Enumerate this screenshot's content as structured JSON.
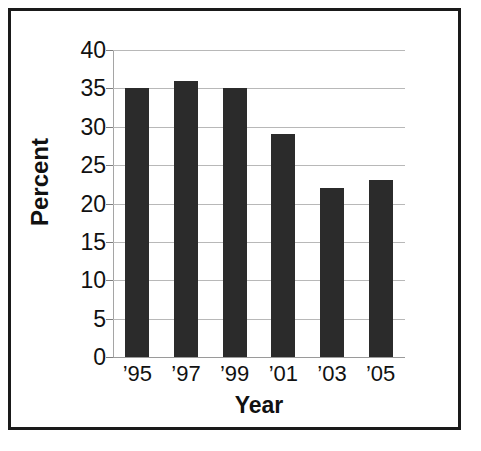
{
  "chart_data": {
    "type": "bar",
    "title": "",
    "subtitle": "",
    "xlabel": "Year",
    "ylabel": "Percent",
    "categories": [
      "’95",
      "’97",
      "’99",
      "’01",
      "’03",
      "’05"
    ],
    "values": [
      35,
      36,
      35,
      29,
      22,
      23
    ],
    "ylim": [
      0,
      40
    ],
    "yticks": [
      0,
      5,
      10,
      15,
      20,
      25,
      30,
      35,
      40
    ],
    "ytick_labels": [
      "0",
      "5",
      "10",
      "15",
      "20",
      "25",
      "30",
      "35",
      "40"
    ],
    "grid": true,
    "grid_axis": "y",
    "legend": false,
    "legend_position": "none",
    "bar_color": "#2b2b2b",
    "grid_color": "#b8b8b8",
    "axis_color": "#a5a5a5",
    "text_color": "#111111",
    "background_color": "#ffffff",
    "frame_color": "#1a1a1a"
  }
}
